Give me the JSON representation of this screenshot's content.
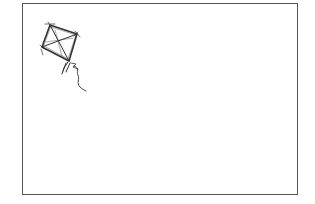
{
  "image": {
    "subject": "kite-line-drawing",
    "description": "Hand-drawn sketch of a diamond kite with cross struts, tail bows and a trailing string inside a rectangular frame",
    "colors": {
      "background": "#ffffff",
      "frame": "#555555",
      "ink": "#333333"
    }
  }
}
